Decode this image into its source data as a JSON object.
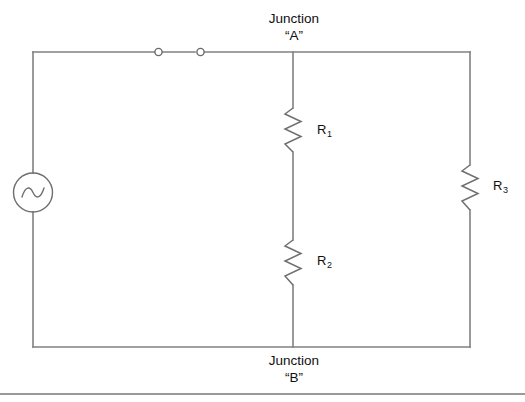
{
  "diagram": {
    "background_color": "#ffffff",
    "wire_color": "#808080",
    "component_color": "#6f6f6f",
    "text_color": "#101010"
  },
  "junctions": {
    "a": {
      "name": "junction-a",
      "line1": "Junction",
      "line2": "“A”"
    },
    "b": {
      "name": "junction-b",
      "line1": "Junction",
      "line2": "“B”"
    }
  },
  "components": {
    "source": {
      "name": "ac-source",
      "symbol": "ac-source-icon",
      "label": ""
    },
    "switch": {
      "name": "switch",
      "symbol": "open-switch-icon",
      "state": "open",
      "terminals": 2
    },
    "resistors": [
      {
        "name": "resistor-r1",
        "symbol": "resistor-icon",
        "label_base": "R",
        "label_sub": "1"
      },
      {
        "name": "resistor-r2",
        "symbol": "resistor-icon",
        "label_base": "R",
        "label_sub": "2"
      },
      {
        "name": "resistor-r3",
        "symbol": "resistor-icon",
        "label_base": "R",
        "label_sub": "3"
      }
    ]
  },
  "footer": {
    "separator": true
  }
}
